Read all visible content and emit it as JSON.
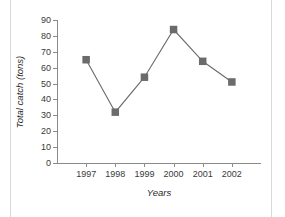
{
  "chart_data": {
    "type": "line",
    "title": "",
    "subtitle": "",
    "xlabel": "Years",
    "ylabel": "Total catch (tons)",
    "categories": [
      "1997",
      "1998",
      "1999",
      "2000",
      "2001",
      "2002"
    ],
    "values": [
      65,
      32,
      54,
      84,
      64,
      51
    ],
    "series": [
      {
        "name": "Total catch",
        "values": [
          65,
          32,
          54,
          84,
          64,
          51
        ]
      }
    ],
    "ylim": [
      0,
      90
    ],
    "ytick_step": 10,
    "yticks": [
      0,
      10,
      20,
      30,
      40,
      50,
      60,
      70,
      80,
      90
    ],
    "ytick_labels": [
      "0",
      "10",
      "20",
      "30",
      "40",
      "50",
      "60",
      "70",
      "80",
      "90"
    ],
    "grid": false,
    "legend": false,
    "legend_position": "none",
    "marker": "square",
    "annotations": []
  },
  "style": {
    "series_color": "#6b6b6b",
    "line_color": "#6b6b6b",
    "marker_color": "#6b6b6b",
    "axis_color": "#8a8a8a",
    "tick_label_color": "#3a3a3a",
    "axis_title_color": "#1f1f1f",
    "background": "#ffffff",
    "edge_rule_color": "#d9d9d9"
  }
}
